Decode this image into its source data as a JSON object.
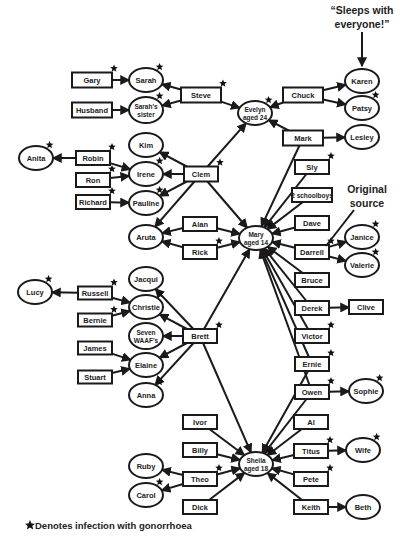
{
  "annotations": {
    "sleeps_with_everyone": [
      "“Sleeps with",
      "everyone!”"
    ],
    "original_source": [
      "Original",
      "source"
    ]
  },
  "legend": {
    "text": "Denotes infection with gonorrhoea",
    "icon": "star-icon"
  },
  "nodes": [
    {
      "id": "gary",
      "label": [
        "Gary"
      ],
      "shape": "rect",
      "x": 92,
      "y": 80,
      "w": 40,
      "h": 15,
      "infected": true
    },
    {
      "id": "sarah",
      "label": [
        "Sarah"
      ],
      "shape": "ellipse",
      "x": 146,
      "y": 80,
      "rx": 17,
      "ry": 12,
      "infected": true
    },
    {
      "id": "husband",
      "label": [
        "Husband"
      ],
      "shape": "rect",
      "x": 92,
      "y": 110,
      "w": 40,
      "h": 15,
      "infected": false
    },
    {
      "id": "sarahs_sister",
      "label": [
        "Sarah's",
        "sister"
      ],
      "shape": "ellipse",
      "x": 146,
      "y": 110,
      "rx": 17,
      "ry": 13,
      "infected": true
    },
    {
      "id": "steve",
      "label": [
        "Steve"
      ],
      "shape": "rect",
      "x": 201,
      "y": 95,
      "w": 40,
      "h": 15,
      "infected": true
    },
    {
      "id": "evelyn",
      "label": [
        "Evelyn",
        "aged 24"
      ],
      "shape": "ellipse",
      "x": 255,
      "y": 113,
      "rx": 17,
      "ry": 12,
      "infected": true
    },
    {
      "id": "chuck",
      "label": [
        "Chuck"
      ],
      "shape": "rect",
      "x": 303,
      "y": 95,
      "w": 40,
      "h": 15,
      "infected": false
    },
    {
      "id": "karen",
      "label": [
        "Karen"
      ],
      "shape": "ellipse",
      "x": 362,
      "y": 81,
      "rx": 17,
      "ry": 12,
      "infected": false
    },
    {
      "id": "patsy",
      "label": [
        "Patsy"
      ],
      "shape": "ellipse",
      "x": 362,
      "y": 108,
      "rx": 17,
      "ry": 12,
      "infected": true
    },
    {
      "id": "mark",
      "label": [
        "Mark"
      ],
      "shape": "rect",
      "x": 303,
      "y": 138,
      "w": 40,
      "h": 15,
      "infected": false
    },
    {
      "id": "lesley",
      "label": [
        "Lesley"
      ],
      "shape": "ellipse",
      "x": 362,
      "y": 137,
      "rx": 17,
      "ry": 12,
      "infected": false
    },
    {
      "id": "anita",
      "label": [
        "Anita"
      ],
      "shape": "ellipse",
      "x": 36,
      "y": 158,
      "rx": 17,
      "ry": 12,
      "infected": true
    },
    {
      "id": "robin",
      "label": [
        "Robin"
      ],
      "shape": "rect",
      "x": 93,
      "y": 158,
      "w": 34,
      "h": 14,
      "infected": true
    },
    {
      "id": "ron",
      "label": [
        "Ron"
      ],
      "shape": "rect",
      "x": 93,
      "y": 180,
      "w": 34,
      "h": 14,
      "infected": true
    },
    {
      "id": "richard",
      "label": [
        "Richard"
      ],
      "shape": "rect",
      "x": 93,
      "y": 202,
      "w": 34,
      "h": 14,
      "infected": true
    },
    {
      "id": "kim",
      "label": [
        "Kim"
      ],
      "shape": "ellipse",
      "x": 146,
      "y": 145,
      "rx": 17,
      "ry": 12,
      "infected": false
    },
    {
      "id": "irene",
      "label": [
        "Irene"
      ],
      "shape": "ellipse",
      "x": 146,
      "y": 174,
      "rx": 17,
      "ry": 12,
      "infected": true
    },
    {
      "id": "pauline",
      "label": [
        "Pauline"
      ],
      "shape": "ellipse",
      "x": 146,
      "y": 203,
      "rx": 17,
      "ry": 12,
      "infected": true
    },
    {
      "id": "clem",
      "label": [
        "Clem"
      ],
      "shape": "rect",
      "x": 201,
      "y": 174,
      "w": 34,
      "h": 15,
      "infected": true
    },
    {
      "id": "aruta",
      "label": [
        "Aruta"
      ],
      "shape": "ellipse",
      "x": 146,
      "y": 237,
      "rx": 17,
      "ry": 12,
      "infected": false
    },
    {
      "id": "alan",
      "label": [
        "Alan"
      ],
      "shape": "rect",
      "x": 200,
      "y": 224,
      "w": 34,
      "h": 14,
      "infected": false
    },
    {
      "id": "rick",
      "label": [
        "Rick"
      ],
      "shape": "rect",
      "x": 200,
      "y": 252,
      "w": 34,
      "h": 14,
      "infected": true
    },
    {
      "id": "mary",
      "label": [
        "Mary",
        "aged 14"
      ],
      "shape": "ellipse",
      "x": 256,
      "y": 238,
      "rx": 17,
      "ry": 12,
      "infected": true
    },
    {
      "id": "sly",
      "label": [
        "Sly"
      ],
      "shape": "rect",
      "x": 312,
      "y": 167,
      "w": 34,
      "h": 14,
      "infected": true
    },
    {
      "id": "schoolboys",
      "label": [
        "2 schoolboys"
      ],
      "shape": "rect",
      "x": 312,
      "y": 195,
      "w": 40,
      "h": 14,
      "infected": false
    },
    {
      "id": "dave",
      "label": [
        "Dave"
      ],
      "shape": "rect",
      "x": 312,
      "y": 223,
      "w": 34,
      "h": 14,
      "infected": false
    },
    {
      "id": "darrell",
      "label": [
        "Darrell"
      ],
      "shape": "rect",
      "x": 312,
      "y": 252,
      "w": 34,
      "h": 14,
      "infected": true
    },
    {
      "id": "janice",
      "label": [
        "Janice"
      ],
      "shape": "ellipse",
      "x": 362,
      "y": 237,
      "rx": 17,
      "ry": 12,
      "infected": true
    },
    {
      "id": "valerie",
      "label": [
        "Valerie"
      ],
      "shape": "ellipse",
      "x": 362,
      "y": 265,
      "rx": 17,
      "ry": 12,
      "infected": true
    },
    {
      "id": "bruce",
      "label": [
        "Bruce"
      ],
      "shape": "rect",
      "x": 312,
      "y": 280,
      "w": 34,
      "h": 14,
      "infected": false
    },
    {
      "id": "derek",
      "label": [
        "Derek"
      ],
      "shape": "rect",
      "x": 312,
      "y": 308,
      "w": 34,
      "h": 14,
      "infected": false
    },
    {
      "id": "clive",
      "label": [
        "Clive"
      ],
      "shape": "rect",
      "x": 366,
      "y": 307,
      "w": 34,
      "h": 14,
      "infected": false
    },
    {
      "id": "victor",
      "label": [
        "Victor"
      ],
      "shape": "rect",
      "x": 312,
      "y": 336,
      "w": 34,
      "h": 14,
      "infected": true
    },
    {
      "id": "ernie",
      "label": [
        "Ernie"
      ],
      "shape": "rect",
      "x": 312,
      "y": 364,
      "w": 34,
      "h": 14,
      "infected": true
    },
    {
      "id": "owen",
      "label": [
        "Owen"
      ],
      "shape": "rect",
      "x": 312,
      "y": 392,
      "w": 34,
      "h": 14,
      "infected": true
    },
    {
      "id": "sophie",
      "label": [
        "Sophie"
      ],
      "shape": "ellipse",
      "x": 366,
      "y": 391,
      "rx": 17,
      "ry": 12,
      "infected": true
    },
    {
      "id": "lucy",
      "label": [
        "Lucy"
      ],
      "shape": "ellipse",
      "x": 35,
      "y": 292,
      "rx": 17,
      "ry": 12,
      "infected": true
    },
    {
      "id": "russell",
      "label": [
        "Russell"
      ],
      "shape": "rect",
      "x": 95,
      "y": 293,
      "w": 34,
      "h": 13,
      "infected": true
    },
    {
      "id": "bernie",
      "label": [
        "Bernie"
      ],
      "shape": "rect",
      "x": 95,
      "y": 320,
      "w": 34,
      "h": 13,
      "infected": true
    },
    {
      "id": "james",
      "label": [
        "James"
      ],
      "shape": "rect",
      "x": 95,
      "y": 348,
      "w": 34,
      "h": 13,
      "infected": false
    },
    {
      "id": "stuart",
      "label": [
        "Stuart"
      ],
      "shape": "rect",
      "x": 95,
      "y": 377,
      "w": 34,
      "h": 13,
      "infected": false
    },
    {
      "id": "jacqui",
      "label": [
        "Jacqui"
      ],
      "shape": "ellipse",
      "x": 146,
      "y": 279,
      "rx": 17,
      "ry": 12,
      "infected": false
    },
    {
      "id": "christie",
      "label": [
        "Christie"
      ],
      "shape": "ellipse",
      "x": 146,
      "y": 307,
      "rx": 17,
      "ry": 12,
      "infected": true
    },
    {
      "id": "seven_waafs",
      "label": [
        "Seven",
        "WAAF's"
      ],
      "shape": "ellipse",
      "x": 146,
      "y": 336,
      "rx": 17,
      "ry": 13,
      "infected": false
    },
    {
      "id": "elaine",
      "label": [
        "Elaine"
      ],
      "shape": "ellipse",
      "x": 146,
      "y": 365,
      "rx": 17,
      "ry": 12,
      "infected": false
    },
    {
      "id": "anna",
      "label": [
        "Anna"
      ],
      "shape": "ellipse",
      "x": 146,
      "y": 395,
      "rx": 17,
      "ry": 12,
      "infected": true
    },
    {
      "id": "brett",
      "label": [
        "Brett"
      ],
      "shape": "rect",
      "x": 200,
      "y": 336,
      "w": 34,
      "h": 14,
      "infected": true
    },
    {
      "id": "ivor",
      "label": [
        "Ivor"
      ],
      "shape": "rect",
      "x": 200,
      "y": 422,
      "w": 34,
      "h": 14,
      "infected": false
    },
    {
      "id": "billy",
      "label": [
        "Billy"
      ],
      "shape": "rect",
      "x": 200,
      "y": 450,
      "w": 34,
      "h": 14,
      "infected": false
    },
    {
      "id": "theo",
      "label": [
        "Theo"
      ],
      "shape": "rect",
      "x": 200,
      "y": 479,
      "w": 34,
      "h": 14,
      "infected": true
    },
    {
      "id": "dick",
      "label": [
        "Dick"
      ],
      "shape": "rect",
      "x": 200,
      "y": 507,
      "w": 34,
      "h": 14,
      "infected": false
    },
    {
      "id": "ruby",
      "label": [
        "Ruby"
      ],
      "shape": "ellipse",
      "x": 146,
      "y": 466,
      "rx": 17,
      "ry": 12,
      "infected": false
    },
    {
      "id": "carol",
      "label": [
        "Carol"
      ],
      "shape": "ellipse",
      "x": 146,
      "y": 495,
      "rx": 17,
      "ry": 12,
      "infected": true
    },
    {
      "id": "sheila",
      "label": [
        "Sheila",
        "aged 18"
      ],
      "shape": "ellipse",
      "x": 256,
      "y": 464,
      "rx": 17,
      "ry": 12,
      "infected": true
    },
    {
      "id": "al",
      "label": [
        "Al"
      ],
      "shape": "rect",
      "x": 311,
      "y": 422,
      "w": 34,
      "h": 14,
      "infected": false
    },
    {
      "id": "titus",
      "label": [
        "Titus"
      ],
      "shape": "rect",
      "x": 311,
      "y": 451,
      "w": 34,
      "h": 14,
      "infected": true
    },
    {
      "id": "wife",
      "label": [
        "Wife"
      ],
      "shape": "ellipse",
      "x": 363,
      "y": 450,
      "rx": 17,
      "ry": 12,
      "infected": true
    },
    {
      "id": "pete",
      "label": [
        "Pete"
      ],
      "shape": "rect",
      "x": 311,
      "y": 479,
      "w": 34,
      "h": 14,
      "infected": true
    },
    {
      "id": "keith",
      "label": [
        "Keith"
      ],
      "shape": "rect",
      "x": 311,
      "y": 507,
      "w": 34,
      "h": 14,
      "infected": false
    },
    {
      "id": "beth",
      "label": [
        "Beth"
      ],
      "shape": "ellipse",
      "x": 363,
      "y": 507,
      "rx": 17,
      "ry": 12,
      "infected": false
    }
  ],
  "edges": [
    [
      "gary",
      "sarah"
    ],
    [
      "husband",
      "sarahs_sister"
    ],
    [
      "steve",
      "sarah"
    ],
    [
      "steve",
      "sarahs_sister"
    ],
    [
      "steve",
      "evelyn"
    ],
    [
      "chuck",
      "evelyn"
    ],
    [
      "chuck",
      "karen"
    ],
    [
      "chuck",
      "patsy"
    ],
    [
      "mark",
      "evelyn"
    ],
    [
      "mark",
      "lesley"
    ],
    [
      "robin",
      "anita"
    ],
    [
      "robin",
      "irene"
    ],
    [
      "ron",
      "irene"
    ],
    [
      "richard",
      "pauline"
    ],
    [
      "clem",
      "kim"
    ],
    [
      "clem",
      "irene"
    ],
    [
      "clem",
      "pauline"
    ],
    [
      "clem",
      "aruta"
    ],
    [
      "clem",
      "evelyn"
    ],
    [
      "clem",
      "mary"
    ],
    [
      "alan",
      "aruta"
    ],
    [
      "rick",
      "aruta"
    ],
    [
      "alan",
      "mary"
    ],
    [
      "rick",
      "mary"
    ],
    [
      "sly",
      "mary"
    ],
    [
      "schoolboys",
      "mary"
    ],
    [
      "dave",
      "mary"
    ],
    [
      "darrell",
      "mary"
    ],
    [
      "darrell",
      "janice"
    ],
    [
      "darrell",
      "valerie"
    ],
    [
      "bruce",
      "mary"
    ],
    [
      "derek",
      "mary"
    ],
    [
      "derek",
      "clive"
    ],
    [
      "victor",
      "mary"
    ],
    [
      "ernie",
      "mary"
    ],
    [
      "owen",
      "mary"
    ],
    [
      "owen",
      "sophie"
    ],
    [
      "mark",
      "mary"
    ],
    [
      "russell",
      "lucy"
    ],
    [
      "russell",
      "christie"
    ],
    [
      "bernie",
      "christie"
    ],
    [
      "james",
      "elaine"
    ],
    [
      "stuart",
      "elaine"
    ],
    [
      "brett",
      "jacqui"
    ],
    [
      "brett",
      "christie"
    ],
    [
      "brett",
      "seven_waafs"
    ],
    [
      "brett",
      "elaine"
    ],
    [
      "brett",
      "anna"
    ],
    [
      "brett",
      "mary"
    ],
    [
      "brett",
      "sheila"
    ],
    [
      "ivor",
      "sheila"
    ],
    [
      "billy",
      "sheila"
    ],
    [
      "theo",
      "sheila"
    ],
    [
      "dick",
      "sheila"
    ],
    [
      "theo",
      "ruby"
    ],
    [
      "theo",
      "carol"
    ],
    [
      "al",
      "sheila"
    ],
    [
      "titus",
      "sheila"
    ],
    [
      "titus",
      "wife"
    ],
    [
      "pete",
      "sheila"
    ],
    [
      "keith",
      "sheila"
    ],
    [
      "keith",
      "beth"
    ],
    [
      "owen",
      "sheila"
    ],
    [
      "ernie",
      "sheila"
    ]
  ]
}
